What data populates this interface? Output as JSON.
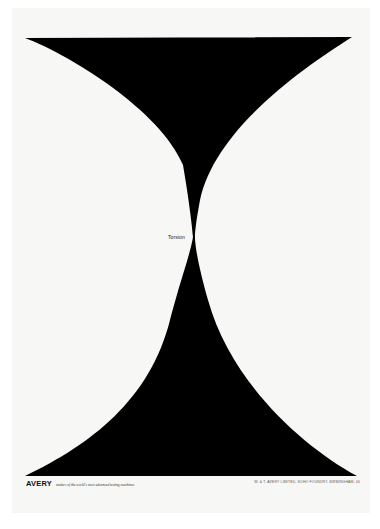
{
  "poster": {
    "shape_label": "Torsion",
    "brand": "AVERY",
    "tagline": "makers of the world's most advanced testing machines",
    "address": "W. & T. AVERY LIMITED, SOHO FOUNDRY, BIRMINGHAM, 40",
    "colors": {
      "ink": "#000000",
      "paper": "#f7f7f5",
      "background": "#ffffff"
    },
    "shape": {
      "type": "hourglass",
      "top_edge": {
        "y": 38,
        "x_left": 25,
        "x_right": 352
      },
      "bottom_edge": {
        "y": 476,
        "x_left": 25,
        "x_right": 357
      },
      "waist": {
        "x": 195,
        "y": 237
      }
    }
  }
}
